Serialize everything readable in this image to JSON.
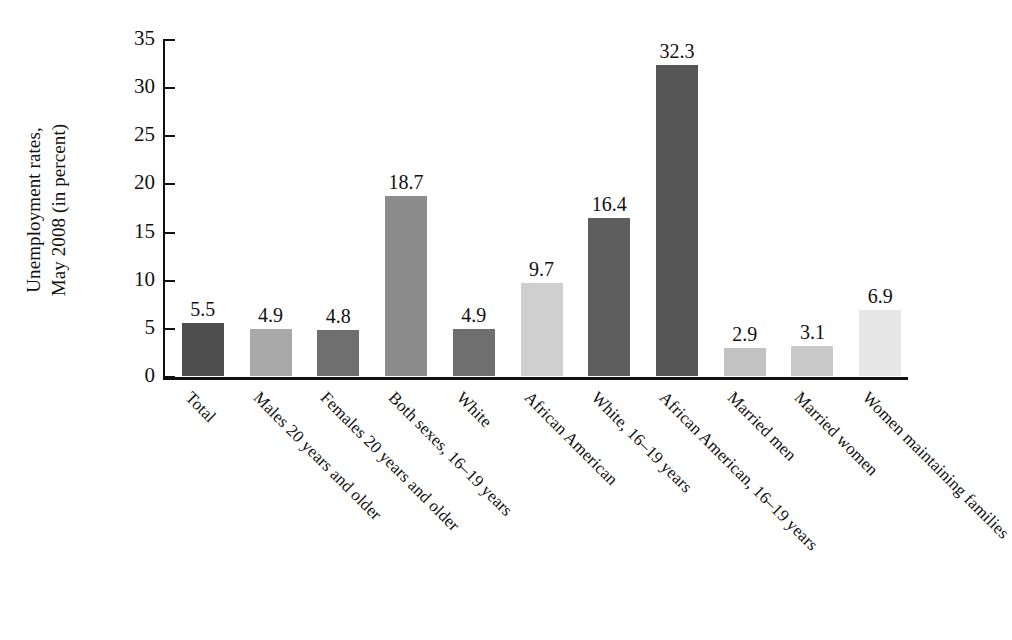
{
  "chart_data": {
    "type": "bar",
    "title": "",
    "subtitle": "",
    "xlabel": "",
    "ylabel": "Unemployment rates, May 2008 (in percent)",
    "ylabel_lines": [
      "Unemployment rates,",
      "May 2008 (in percent)"
    ],
    "ylim": [
      0,
      35
    ],
    "yticks": [
      0,
      5,
      10,
      15,
      20,
      25,
      30,
      35
    ],
    "ytick_labels": [
      "0",
      "5",
      "10",
      "15",
      "20",
      "25",
      "30",
      "35"
    ],
    "grid": false,
    "legend": "none",
    "value_labels": true,
    "categories": [
      "Total",
      "Males 20 years and older",
      "Females 20 years and older",
      "Both sexes, 16–19 years",
      "White",
      "African American",
      "White, 16–19 years",
      "African American, 16–19 years",
      "Married men",
      "Married women",
      "Women maintaining families"
    ],
    "values": [
      5.5,
      4.9,
      4.8,
      18.7,
      4.9,
      9.7,
      16.4,
      32.3,
      2.9,
      3.1,
      6.9
    ],
    "value_label_text": [
      "5.5",
      "4.9",
      "4.8",
      "18.7",
      "4.9",
      "9.7",
      "16.4",
      "32.3",
      "2.9",
      "3.1",
      "6.9"
    ],
    "bar_colors": [
      "#4d4d4d",
      "#a9a9a9",
      "#6f6f6f",
      "#8c8c8c",
      "#6f6f6f",
      "#cfcfcf",
      "#5e5e5e",
      "#555555",
      "#c2c2c2",
      "#c9c9c9",
      "#e6e6e6"
    ],
    "axis_color": "#111111",
    "background_color": "#ffffff"
  }
}
